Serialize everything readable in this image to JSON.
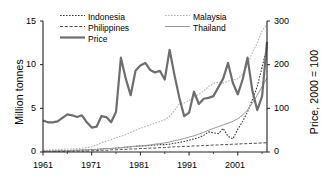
{
  "chart_data": {
    "type": "line",
    "title": "",
    "xlabel": "",
    "ylabel": "Million tonnes",
    "y2label": "Price, 2000 = 100",
    "xlim": [
      1961,
      2007
    ],
    "ylim": [
      0,
      15
    ],
    "y2lim": [
      0,
      300
    ],
    "grid": false,
    "legend_position": "top-center",
    "xticks": [
      "1961",
      "1971",
      "1981",
      "1991",
      "2001"
    ],
    "xtick_values": [
      1961,
      1971,
      1981,
      1991,
      2001
    ],
    "xminor_ticks": [
      1966,
      1976,
      1986,
      1996,
      2006
    ],
    "yticks": [
      "0",
      "5",
      "10",
      "15"
    ],
    "ytick_values": [
      0,
      5,
      10,
      15
    ],
    "y2ticks": [
      "0",
      "100",
      "200",
      "300"
    ],
    "y2tick_values": [
      0,
      100,
      200,
      300
    ],
    "x": [
      1961,
      1962,
      1963,
      1964,
      1965,
      1966,
      1967,
      1968,
      1969,
      1970,
      1971,
      1972,
      1973,
      1974,
      1975,
      1976,
      1977,
      1978,
      1979,
      1980,
      1981,
      1982,
      1983,
      1984,
      1985,
      1986,
      1987,
      1988,
      1989,
      1990,
      1991,
      1992,
      1993,
      1994,
      1995,
      1996,
      1997,
      1998,
      1999,
      2000,
      2001,
      2002,
      2003,
      2004,
      2005,
      2006,
      2007
    ],
    "series": [
      {
        "name": "Indonesia",
        "axis": "right",
        "style": "dotted",
        "color": "#3a3a3a",
        "width": 1.1,
        "values": [
          2,
          2,
          2,
          2,
          3,
          3,
          3,
          4,
          4,
          5,
          5,
          6,
          7,
          8,
          8,
          9,
          10,
          11,
          12,
          13,
          14,
          14,
          15,
          16,
          17,
          17,
          18,
          20,
          22,
          24,
          27,
          30,
          33,
          38,
          46,
          44,
          42,
          54,
          36,
          30,
          52,
          70,
          92,
          120,
          150,
          195,
          240
        ]
      },
      {
        "name": "Malaysia",
        "axis": "right",
        "style": "dotted",
        "color": "#b2b2b2",
        "width": 1.1,
        "values": [
          4,
          4,
          5,
          5,
          6,
          7,
          7,
          8,
          9,
          10,
          12,
          16,
          21,
          25,
          28,
          33,
          36,
          40,
          45,
          50,
          54,
          58,
          62,
          66,
          70,
          74,
          82,
          95,
          110,
          112,
          118,
          126,
          132,
          140,
          150,
          157,
          160,
          158,
          162,
          165,
          168,
          178,
          200,
          228,
          250,
          278,
          292
        ]
      },
      {
        "name": "Philippines",
        "axis": "right",
        "style": "dashed",
        "color": "#4a4a4a",
        "width": 1.0,
        "values": [
          1,
          1,
          1,
          1,
          1,
          2,
          2,
          2,
          2,
          2,
          3,
          3,
          4,
          4,
          5,
          5,
          6,
          6,
          7,
          7,
          8,
          8,
          9,
          9,
          10,
          10,
          11,
          12,
          12,
          13,
          13,
          14,
          14,
          15,
          15,
          16,
          16,
          17,
          17,
          18,
          18,
          19,
          19,
          20,
          20,
          21,
          21
        ]
      },
      {
        "name": "Thailand",
        "axis": "right",
        "style": "solid",
        "color": "#9a9a9a",
        "width": 1.0,
        "values": [
          2,
          2,
          2,
          3,
          3,
          3,
          4,
          4,
          5,
          5,
          6,
          6,
          7,
          8,
          8,
          9,
          10,
          11,
          12,
          13,
          14,
          15,
          16,
          18,
          19,
          21,
          23,
          26,
          28,
          31,
          34,
          37,
          41,
          45,
          50,
          54,
          58,
          62,
          66,
          70,
          76,
          85,
          96,
          112,
          130,
          150,
          170
        ]
      },
      {
        "name": "Price",
        "axis": "left",
        "style": "solid",
        "color": "#6e6e6e",
        "width": 2.2,
        "values": [
          3.6,
          3.4,
          3.4,
          3.5,
          3.9,
          4.3,
          4.2,
          4.0,
          4.2,
          3.4,
          2.8,
          2.9,
          4.1,
          4.0,
          3.4,
          4.6,
          10.8,
          8.4,
          6.5,
          9.3,
          9.9,
          10.2,
          9.4,
          9.1,
          9.3,
          8.3,
          11.7,
          8.8,
          6.2,
          4.1,
          4.5,
          6.9,
          5.5,
          6.1,
          6.2,
          6.4,
          7.4,
          8.4,
          10.2,
          7.9,
          6.6,
          8.3,
          10.8,
          7.0,
          4.8,
          6.4,
          12.6
        ]
      }
    ]
  },
  "legend": {
    "entries": [
      {
        "label": "Indonesia",
        "key": "indonesia"
      },
      {
        "label": "Malaysia",
        "key": "malaysia"
      },
      {
        "label": "Philippines",
        "key": "philippines"
      },
      {
        "label": "Thailand",
        "key": "thailand"
      },
      {
        "label": "Price",
        "key": "price"
      }
    ]
  },
  "axes": {
    "left_title": "Million tonnes",
    "right_title": "Price, 2000 = 100",
    "ytick_0": "0",
    "ytick_5": "5",
    "ytick_10": "10",
    "ytick_15": "15",
    "y2tick_0": "0",
    "y2tick_100": "100",
    "y2tick_200": "200",
    "y2tick_300": "300",
    "xtick_1961": "1961",
    "xtick_1971": "1971",
    "xtick_1981": "1981",
    "xtick_1991": "1991",
    "xtick_2001": "2001"
  }
}
